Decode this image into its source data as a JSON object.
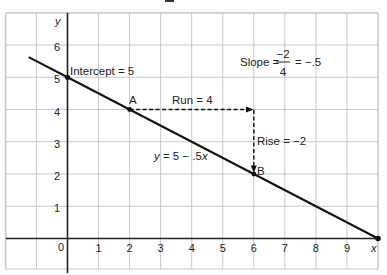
{
  "chart_data": {
    "type": "line",
    "title": "",
    "xlabel": "x",
    "ylabel": "y",
    "xlim": [
      -2,
      10
    ],
    "ylim": [
      -1,
      7
    ],
    "x_ticks": [
      "0",
      "1",
      "2",
      "3",
      "4",
      "5",
      "6",
      "7",
      "8",
      "9"
    ],
    "y_ticks": [
      "1",
      "2",
      "3",
      "4",
      "5",
      "6"
    ],
    "grid": true,
    "series": [
      {
        "name": "y = 5 − .5x",
        "x": [
          -1.25,
          0,
          2,
          6,
          10
        ],
        "y": [
          5.625,
          5,
          4,
          2,
          0
        ]
      }
    ],
    "points": [
      {
        "label": "Intercept = 5",
        "x": 0,
        "y": 5
      },
      {
        "label": "A",
        "x": 2,
        "y": 4
      },
      {
        "label": "B",
        "x": 6,
        "y": 2
      },
      {
        "label": "",
        "x": 10,
        "y": 0
      }
    ],
    "annotations": {
      "run": {
        "label": "Run = 4",
        "from": [
          2,
          4
        ],
        "to": [
          6,
          4
        ]
      },
      "rise": {
        "label": "Rise = −2",
        "from": [
          6,
          4
        ],
        "to": [
          6,
          2
        ]
      },
      "equation": "y = 5 − .5x",
      "slope": {
        "prefix": "Slope =",
        "numerator": "−2",
        "denominator": "4",
        "result": "= −.5"
      }
    }
  },
  "labels": {
    "y_axis": "y",
    "x_axis": "x",
    "intercept": "Intercept = 5",
    "point_a": "A",
    "point_b": "B",
    "run": "Run = 4",
    "rise": "Rise = −2",
    "equation_y": "y",
    "equation_rest": " = 5 − .5",
    "equation_x": "x",
    "slope_prefix": "Slope =",
    "slope_num": "−2",
    "slope_den": "4",
    "slope_result": "= −.5",
    "origin": "0"
  },
  "style": {
    "grid_color": "#c8c8c8",
    "line_color": "#111111",
    "axis_color": "#222222"
  }
}
